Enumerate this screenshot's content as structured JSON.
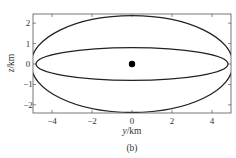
{
  "figure": {
    "caption": "(b)"
  },
  "chart_data": {
    "type": "line",
    "title": "",
    "xlabel_var": "y",
    "xlabel_unit": "/km",
    "ylabel_var": "z",
    "ylabel_unit": "/km",
    "xlim": [
      -4.95,
      4.95
    ],
    "ylim": [
      -2.4,
      2.45
    ],
    "xticks": [
      -4,
      -2,
      0,
      2,
      4
    ],
    "xtick_labels": [
      "−4",
      "−2",
      "0",
      "2",
      "4"
    ],
    "yticks": [
      -2,
      -1,
      0,
      1,
      2
    ],
    "ytick_labels": [
      "−2",
      "−1",
      "0",
      "1",
      "2"
    ],
    "grid": false,
    "legend": null,
    "mirror_ticks": true,
    "series": [
      {
        "name": "outer-trajectory",
        "shape": "ellipse",
        "center": [
          0,
          0
        ],
        "semi_axis_y": 5.05,
        "semi_axis_z": 2.37,
        "clipped_to_axes": true,
        "color": "#222222"
      },
      {
        "name": "inner-trajectory",
        "shape": "ellipse",
        "center": [
          0,
          0
        ],
        "semi_axis_y": 4.8,
        "semi_axis_z": 0.8,
        "clipped_to_axes": true,
        "color": "#222222"
      }
    ],
    "markers": [
      {
        "name": "center-point",
        "y": 0,
        "z": 0,
        "color": "#000000",
        "size": 3.2
      }
    ]
  },
  "layout": {
    "plot_left": 33,
    "plot_top": 14,
    "plot_right": 231,
    "plot_bottom": 113
  }
}
